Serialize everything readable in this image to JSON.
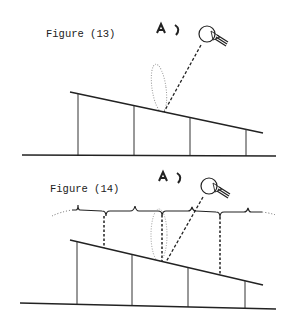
{
  "figures": [
    {
      "label": "Figure (13)",
      "eye_symbol": "A)",
      "elements": [
        "light-bulb",
        "dashed-light-ray",
        "dotted-ellipse-highlight",
        "sloped-surface",
        "support-posts",
        "ground-line"
      ]
    },
    {
      "label": "Figure (14)",
      "eye_symbol": "A)",
      "elements": [
        "light-bulb",
        "dashed-light-ray",
        "dotted-ellipse-highlight",
        "wavy-upper-surface",
        "dashed-projection-lines",
        "sloped-surface",
        "support-posts",
        "ground-line"
      ]
    }
  ],
  "colors": {
    "ink": "#222222",
    "dotted": "#999999"
  }
}
